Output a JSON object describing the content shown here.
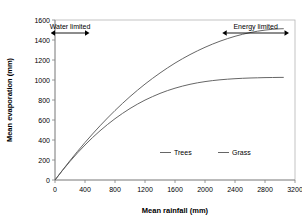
{
  "chart_data": {
    "type": "line",
    "title": "",
    "xlabel": "Mean rainfall (mm)",
    "ylabel": "Mean evaporation (mm)",
    "xlim": [
      0,
      3200
    ],
    "ylim": [
      0,
      1600
    ],
    "xticks": [
      0,
      400,
      800,
      1200,
      1600,
      2000,
      2400,
      2800,
      3200
    ],
    "yticks": [
      0,
      200,
      400,
      600,
      800,
      1000,
      1200,
      1400,
      1600
    ],
    "grid": false,
    "legend_position": "inside-lower-right",
    "x": [
      0,
      100,
      200,
      300,
      400,
      500,
      600,
      700,
      800,
      900,
      1000,
      1100,
      1200,
      1300,
      1400,
      1500,
      1600,
      1700,
      1800,
      1900,
      2000,
      2100,
      2200,
      2300,
      2400,
      2500,
      2600,
      2700,
      2800,
      2900,
      3000,
      3050
    ],
    "series": [
      {
        "name": "Trees",
        "color": "#555555",
        "values": [
          0,
          98,
          194,
          286,
          375,
          460,
          542,
          620,
          695,
          766,
          834,
          898,
          959,
          1016,
          1070,
          1121,
          1169,
          1213,
          1254,
          1292,
          1327,
          1359,
          1388,
          1414,
          1437,
          1457,
          1474,
          1488,
          1499,
          1507,
          1512,
          1513
        ]
      },
      {
        "name": "Grass",
        "color": "#555555",
        "values": [
          0,
          96,
          186,
          271,
          350,
          424,
          492,
          555,
          613,
          666,
          715,
          759,
          799,
          834,
          866,
          894,
          918,
          939,
          957,
          972,
          984,
          994,
          1002,
          1008,
          1013,
          1017,
          1020,
          1022,
          1024,
          1025,
          1026,
          1026
        ]
      }
    ],
    "annotations": [
      {
        "name": "water-limited",
        "label": "Water limited",
        "arrow_x_start": 0,
        "arrow_x_end": 400,
        "arrow_y": 1470,
        "double_headed": true
      },
      {
        "name": "energy-limited",
        "label": "Energy limited",
        "arrow_x_start": 2290,
        "arrow_x_end": 3060,
        "arrow_y": 1470,
        "double_headed": true
      }
    ]
  }
}
